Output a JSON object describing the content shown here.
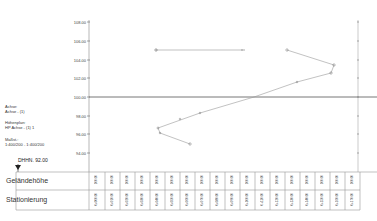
{
  "profile": {
    "y_axis_labels": [
      "108.00",
      "106.00",
      "104.00",
      "102.00",
      "100.00",
      "98.00",
      "96.00",
      "94.00"
    ],
    "reference_level": "100.00",
    "datum": "DHHN. 92.00",
    "legend": {
      "axis_title": "Achse:",
      "axis_value": "Achse - (1)",
      "plan_title": "Höhenplan:",
      "plan_value": "HP Achse - (1) 1",
      "scale_title": "Maßst.:",
      "scale_value": "1:400/200 - 1:400/200"
    }
  },
  "table": {
    "rows": [
      {
        "label": "Geländehöhe",
        "values": [
          "100.00",
          "100.00",
          "100.00",
          "100.00",
          "100.00",
          "100.00",
          "100.00",
          "100.00",
          "100.00",
          "100.00",
          "100.00",
          "100.00",
          "100.00",
          "100.00",
          "100.00",
          "100.00",
          "100.00",
          "100.00"
        ]
      },
      {
        "label": "Stationierung",
        "values": [
          "0+000.00",
          "0+010.00",
          "0+020.00",
          "0+030.00",
          "0+040.00",
          "0+050.00",
          "0+060.00",
          "0+070.00",
          "0+080.00",
          "0+090.00",
          "0+100.00",
          "0+110.00",
          "0+120.00",
          "0+130.00",
          "0+140.00",
          "0+150.00",
          "0+160.00",
          "0+170.00"
        ]
      }
    ]
  },
  "chart_data": {
    "type": "line",
    "title": "",
    "xlabel": "Stationierung",
    "ylabel": "Höhe",
    "ylim": [
      94,
      108
    ],
    "y_ticks": [
      108,
      106,
      104,
      102,
      100,
      98,
      96,
      94
    ],
    "reference_line": 100,
    "series": [
      {
        "name": "segment-1",
        "points": [
          [
            156,
            105.2
          ],
          [
            243,
            105.2
          ]
        ]
      },
      {
        "name": "segment-2",
        "points": [
          [
            287,
            105.2
          ],
          [
            334,
            103.6
          ],
          [
            331,
            102.7
          ],
          [
            297,
            101.8
          ],
          [
            254,
            100.0
          ],
          [
            200,
            98.6
          ],
          [
            158,
            96.7
          ],
          [
            160,
            96.2
          ],
          [
            190,
            95.0
          ]
        ]
      }
    ]
  }
}
